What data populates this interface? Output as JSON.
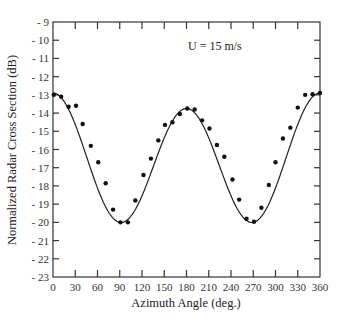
{
  "chart_data": {
    "type": "scatter",
    "title": "",
    "annotation": "U = 15 m/s",
    "xlabel": "Azimuth Angle (deg.)",
    "ylabel": "Normalized Radar Cross Section (dB)",
    "xlim": [
      0,
      360
    ],
    "ylim": [
      -23,
      -9
    ],
    "xticks": [
      0,
      30,
      60,
      90,
      120,
      150,
      180,
      210,
      240,
      270,
      300,
      330,
      360
    ],
    "yticks": [
      -9,
      -10,
      -11,
      -12,
      -13,
      -14,
      -15,
      -16,
      -17,
      -18,
      -19,
      -20,
      -21,
      -22,
      -23
    ],
    "ytick_labels": [
      "- 9",
      "- 10",
      "- 11",
      "- 12",
      "- 13",
      "- 14",
      "- 15",
      "- 16",
      "- 17",
      "- 18",
      "- 19",
      "- 20",
      "- 21",
      "- 22",
      "- 23"
    ],
    "grid": false,
    "legend": null,
    "series": [
      {
        "name": "Measured",
        "style": "markers",
        "x": [
          1,
          11,
          21,
          31,
          40,
          51,
          61,
          71,
          81,
          91,
          101,
          111,
          122,
          132,
          142,
          151,
          161,
          171,
          181,
          191,
          201,
          211,
          221,
          231,
          242,
          251,
          261,
          271,
          281,
          291,
          300,
          310,
          320,
          330,
          340,
          350,
          360
        ],
        "y": [
          -13.0,
          -13.1,
          -13.65,
          -13.6,
          -14.6,
          -15.8,
          -16.7,
          -17.85,
          -19.3,
          -20.0,
          -20.0,
          -18.8,
          -17.4,
          -16.5,
          -15.5,
          -14.65,
          -14.5,
          -14.05,
          -13.75,
          -13.8,
          -14.4,
          -14.85,
          -15.75,
          -16.4,
          -17.65,
          -18.75,
          -19.8,
          -19.97,
          -19.2,
          -17.95,
          -16.7,
          -15.4,
          -14.8,
          -13.7,
          -13.0,
          -12.97,
          -12.9
        ]
      },
      {
        "name": "Model fit",
        "style": "line",
        "formula": "y = -16.66 + 3.34*cos(2x) + 0.425*cos(x)",
        "params": {
          "A": -16.6625,
          "B": 3.3375,
          "C": 0.425
        }
      }
    ]
  }
}
